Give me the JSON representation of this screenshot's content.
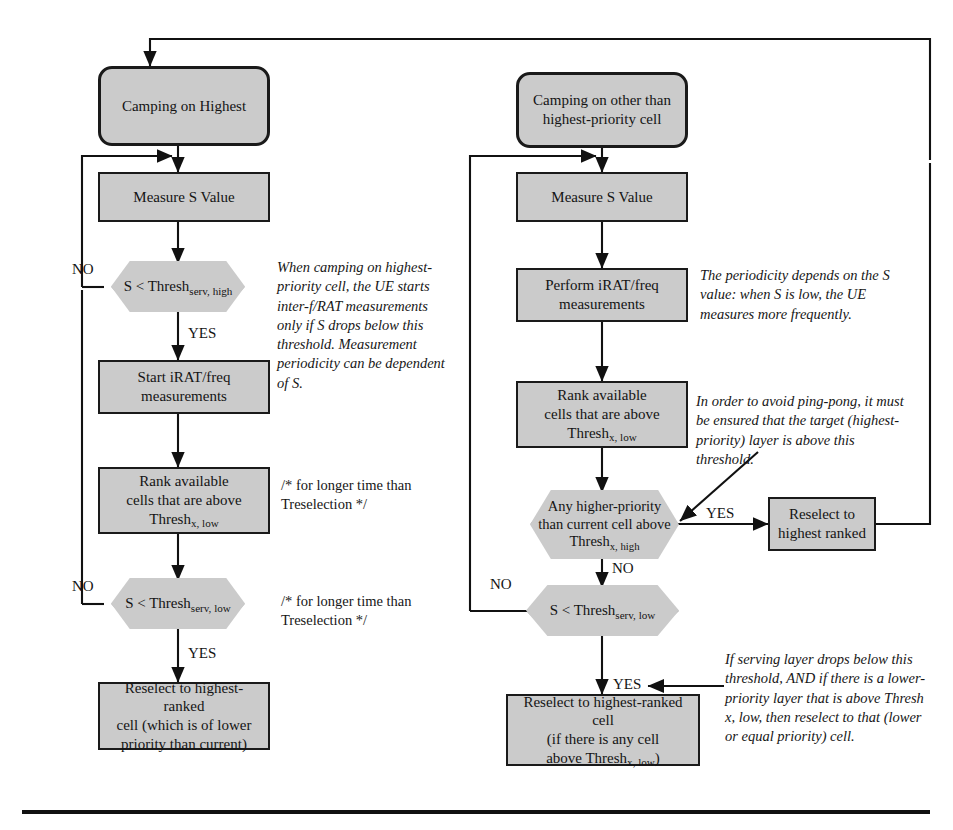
{
  "diagram": {
    "colors": {
      "node_fill": "#cbcbcb",
      "node_border": "#1a1a1a",
      "line": "#111111"
    },
    "left_branch": {
      "start": "Camping on Highest",
      "measure": "Measure S Value",
      "decision_high": "S < Thresh",
      "decision_high_sub": "serv, high",
      "start_irat_line1": "Start iRAT/freq",
      "start_irat_line2": "measurements",
      "rank_line1": "Rank available",
      "rank_line2": "cells that are above",
      "rank_line3": "Thresh",
      "rank_sub": "x, low",
      "decision_low": "S < Thresh",
      "decision_low_sub": "serv, low",
      "reselect_line1": "Reselect to highest-ranked",
      "reselect_line2": "cell (which is of lower",
      "reselect_line3": "priority than current)",
      "yes_1": "YES",
      "yes_2": "YES",
      "no_1": "NO",
      "no_2": "NO"
    },
    "right_branch": {
      "start_line1": "Camping on other than",
      "start_line2": "highest-priority cell",
      "measure": "Measure S Value",
      "perform_line1": "Perform iRAT/freq",
      "perform_line2": "measurements",
      "rank_line1": "Rank available",
      "rank_line2": "cells that are above",
      "rank_line3": "Thresh",
      "rank_sub": "x, low",
      "decision_higher_line1": "Any higher-priority",
      "decision_higher_line2": "than current cell above",
      "decision_higher_line3": "Thresh",
      "decision_higher_sub": "x, high",
      "reselect_top_line1": "Reselect to",
      "reselect_top_line2": "highest ranked",
      "decision_low": "S < Thresh",
      "decision_low_sub": "serv, low",
      "reselect_bottom_line1": "Reselect to highest-ranked cell",
      "reselect_bottom_line2": "(if there is any cell",
      "reselect_bottom_line3": "above Thresh",
      "reselect_bottom_sub": "x, low",
      "reselect_bottom_tail": ")",
      "yes_higher": "YES",
      "no_higher": "NO",
      "no_low": "NO",
      "yes_low": "YES"
    },
    "notes": {
      "note_left_1": "When camping on highest-priority cell, the UE starts inter-f/RAT measurements only if S drops below this threshold. Measurement periodicity can be dependent of S.",
      "note_right_1": "The periodicity depends on the S value: when S is low, the UE measures more frequently.",
      "note_right_2": "In order to avoid ping-pong, it must be ensured that the target (highest-priority) layer is above this threshold.",
      "note_right_3": "If serving layer drops below this threshold, AND if there is a lower-priority layer that is above Thresh x, low, then reselect to that (lower or equal priority) cell."
    },
    "comments": {
      "comment_1": "/* for longer time than\nTreselection */",
      "comment_2": "/* for longer time than\nTreselection */"
    }
  }
}
